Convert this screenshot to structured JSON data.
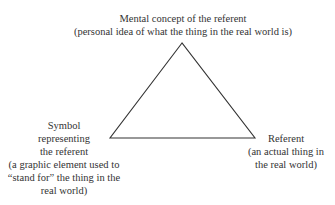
{
  "diagram": {
    "type": "semiotic-triangle",
    "nodes": {
      "top": {
        "lines": [
          "Mental concept of the referent",
          "(personal idea of what the thing in the real world is)"
        ]
      },
      "left": {
        "lines": [
          "Symbol",
          "representing",
          "the referent",
          "(a graphic element used to",
          "“stand for” the thing in the",
          "real world)"
        ]
      },
      "right": {
        "lines": [
          "Referent",
          "(an actual thing in",
          "the real world)"
        ]
      }
    },
    "triangle": {
      "apex": [
        182,
        43
      ],
      "left": [
        110,
        138
      ],
      "right": [
        255,
        138
      ],
      "stroke": "#333333"
    }
  }
}
